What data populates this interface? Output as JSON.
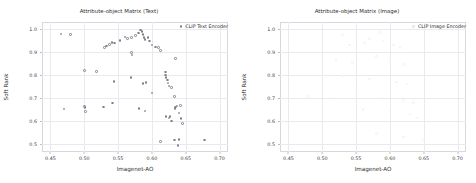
{
  "figure": {
    "width": 476,
    "height": 183,
    "background": "#ffffff",
    "marker_color": "#7f7f88",
    "grid_color": "#e9e9ef"
  },
  "chart_data": [
    {
      "type": "scatter",
      "title": "Attribute-object Matrix (Text)",
      "xlabel": "Imagenet-AO",
      "ylabel": "Soft Rank",
      "xlim": [
        0.4375,
        0.7125
      ],
      "ylim": [
        0.465,
        1.03
      ],
      "xticks": [
        0.45,
        0.5,
        0.55,
        0.6,
        0.65,
        0.7
      ],
      "xticklabels": [
        "0.45",
        "0.50",
        "0.55",
        "0.60",
        "0.65",
        "0.70"
      ],
      "yticks": [
        0.5,
        0.6,
        0.7,
        0.8,
        0.9,
        1.0
      ],
      "yticklabels": [
        "0.5",
        "0.6",
        "0.7",
        "0.8",
        "0.9",
        "1.0"
      ],
      "grid": true,
      "legend": {
        "position": "upper right",
        "entries": [
          "CLIP Text Encoder"
        ]
      },
      "series": [
        {
          "name": "CLIP Text Encoder",
          "points": [
            [
              0.4655,
              0.977
            ],
            [
              0.4795,
              0.976
            ],
            [
              0.53,
              0.918
            ],
            [
              0.533,
              0.925
            ],
            [
              0.537,
              0.932
            ],
            [
              0.541,
              0.94
            ],
            [
              0.5445,
              0.938
            ],
            [
              0.553,
              0.95
            ],
            [
              0.56,
              0.965
            ],
            [
              0.564,
              0.958
            ],
            [
              0.57,
              0.962
            ],
            [
              0.576,
              0.972
            ],
            [
              0.58,
              0.983
            ],
            [
              0.583,
              0.995
            ],
            [
              0.5855,
              0.988
            ],
            [
              0.587,
              0.975
            ],
            [
              0.5885,
              0.962
            ],
            [
              0.59,
              0.955
            ],
            [
              0.594,
              0.963
            ],
            [
              0.596,
              0.948
            ],
            [
              0.6,
              0.93
            ],
            [
              0.605,
              0.922
            ],
            [
              0.61,
              0.918
            ],
            [
              0.613,
              0.905
            ],
            [
              0.57,
              0.898
            ],
            [
              0.5705,
              0.886
            ],
            [
              0.5,
              0.818
            ],
            [
              0.518,
              0.815
            ],
            [
              0.544,
              0.772
            ],
            [
              0.569,
              0.788
            ],
            [
              0.587,
              0.762
            ],
            [
              0.591,
              0.768
            ],
            [
              0.6,
              0.722
            ],
            [
              0.62,
              0.8
            ],
            [
              0.621,
              0.788
            ],
            [
              0.623,
              0.778
            ],
            [
              0.624,
              0.765
            ],
            [
              0.6255,
              0.752
            ],
            [
              0.629,
              0.745
            ],
            [
              0.62,
              0.812
            ],
            [
              0.635,
              0.872
            ],
            [
              0.633,
              0.705
            ],
            [
              0.47,
              0.652
            ],
            [
              0.5,
              0.664
            ],
            [
              0.501,
              0.658
            ],
            [
              0.502,
              0.64
            ],
            [
              0.528,
              0.66
            ],
            [
              0.542,
              0.678
            ],
            [
              0.581,
              0.655
            ],
            [
              0.59,
              0.643
            ],
            [
              0.621,
              0.618
            ],
            [
              0.625,
              0.612
            ],
            [
              0.627,
              0.618
            ],
            [
              0.629,
              0.6
            ],
            [
              0.634,
              0.653
            ],
            [
              0.635,
              0.66
            ],
            [
              0.637,
              0.665
            ],
            [
              0.642,
              0.668
            ],
            [
              0.64,
              0.635
            ],
            [
              0.643,
              0.61
            ],
            [
              0.645,
              0.588
            ],
            [
              0.613,
              0.51
            ],
            [
              0.633,
              0.518
            ],
            [
              0.64,
              0.52
            ],
            [
              0.6385,
              0.492
            ],
            [
              0.678,
              0.518
            ]
          ]
        }
      ]
    },
    {
      "type": "scatter",
      "title": "Attribute-object Matrix (Image)",
      "xlabel": "Imagenet-AO",
      "ylabel": "Soft Rank",
      "xlim": [
        0.4375,
        0.7125
      ],
      "ylim": [
        0.465,
        1.03
      ],
      "xticks": [
        0.45,
        0.5,
        0.55,
        0.6,
        0.65,
        0.7
      ],
      "xticklabels": [
        "0.45",
        "0.50",
        "0.55",
        "0.60",
        "0.65",
        "0.70"
      ],
      "yticks": [
        0.5,
        0.6,
        0.7,
        0.8,
        0.9,
        1.0
      ],
      "yticklabels": [
        "0.5",
        "0.6",
        "0.7",
        "0.8",
        "0.9",
        "1.0"
      ],
      "grid": true,
      "legend": {
        "position": "upper right",
        "entries": [
          "CLIP Image Encoder"
        ]
      },
      "series": [
        {
          "name": "CLIP Image Encoder",
          "points": [
            [
              0.53,
              0.975
            ],
            [
              0.55,
              0.968
            ],
            [
              0.57,
              0.958
            ],
            [
              0.585,
              0.985
            ],
            [
              0.59,
              0.948
            ],
            [
              0.605,
              0.93
            ],
            [
              0.615,
              0.918
            ],
            [
              0.54,
              0.93
            ],
            [
              0.562,
              0.94
            ],
            [
              0.52,
              0.862
            ],
            [
              0.545,
              0.855
            ],
            [
              0.58,
              0.88
            ],
            [
              0.6,
              0.872
            ],
            [
              0.62,
              0.845
            ],
            [
              0.5,
              0.8
            ],
            [
              0.53,
              0.795
            ],
            [
              0.57,
              0.782
            ],
            [
              0.61,
              0.77
            ],
            [
              0.625,
              0.76
            ],
            [
              0.48,
              0.705
            ],
            [
              0.51,
              0.7
            ],
            [
              0.55,
              0.712
            ],
            [
              0.59,
              0.698
            ],
            [
              0.62,
              0.69
            ],
            [
              0.635,
              0.68
            ],
            [
              0.56,
              0.65
            ],
            [
              0.6,
              0.64
            ],
            [
              0.63,
              0.63
            ],
            [
              0.64,
              0.612
            ],
            [
              0.58,
              0.545
            ],
            [
              0.62,
              0.53
            ],
            [
              0.65,
              0.515
            ]
          ]
        }
      ]
    }
  ]
}
